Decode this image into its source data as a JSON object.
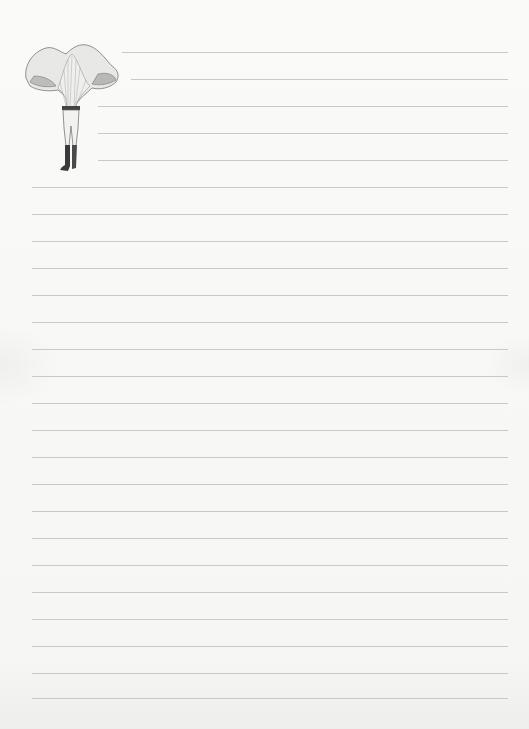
{
  "page": {
    "type": "lined-stationery",
    "background_color": "#f8f8f6",
    "line_color": "#c9c9c7",
    "line_spacing_px": 27,
    "right_edge_x": 508
  },
  "illustration": {
    "subject": "chanterelle-mushroom-headed-figure",
    "description": "Vintage engraving of a figure whose head is a large chanterelle mushroom, wearing breeches and tall boots"
  },
  "lines": [
    {
      "y": 52,
      "x1": 122
    },
    {
      "y": 79,
      "x1": 131
    },
    {
      "y": 106,
      "x1": 98
    },
    {
      "y": 133,
      "x1": 98
    },
    {
      "y": 160,
      "x1": 98
    },
    {
      "y": 187,
      "x1": 32
    },
    {
      "y": 214,
      "x1": 32
    },
    {
      "y": 241,
      "x1": 32
    },
    {
      "y": 268,
      "x1": 32
    },
    {
      "y": 295,
      "x1": 32
    },
    {
      "y": 322,
      "x1": 32
    },
    {
      "y": 349,
      "x1": 32
    },
    {
      "y": 376,
      "x1": 32
    },
    {
      "y": 403,
      "x1": 32
    },
    {
      "y": 430,
      "x1": 32
    },
    {
      "y": 457,
      "x1": 32
    },
    {
      "y": 484,
      "x1": 32
    },
    {
      "y": 511,
      "x1": 32
    },
    {
      "y": 538,
      "x1": 32
    },
    {
      "y": 565,
      "x1": 32
    },
    {
      "y": 592,
      "x1": 32
    },
    {
      "y": 619,
      "x1": 32
    },
    {
      "y": 646,
      "x1": 32
    },
    {
      "y": 673,
      "x1": 32
    },
    {
      "y": 698,
      "x1": 32
    }
  ]
}
